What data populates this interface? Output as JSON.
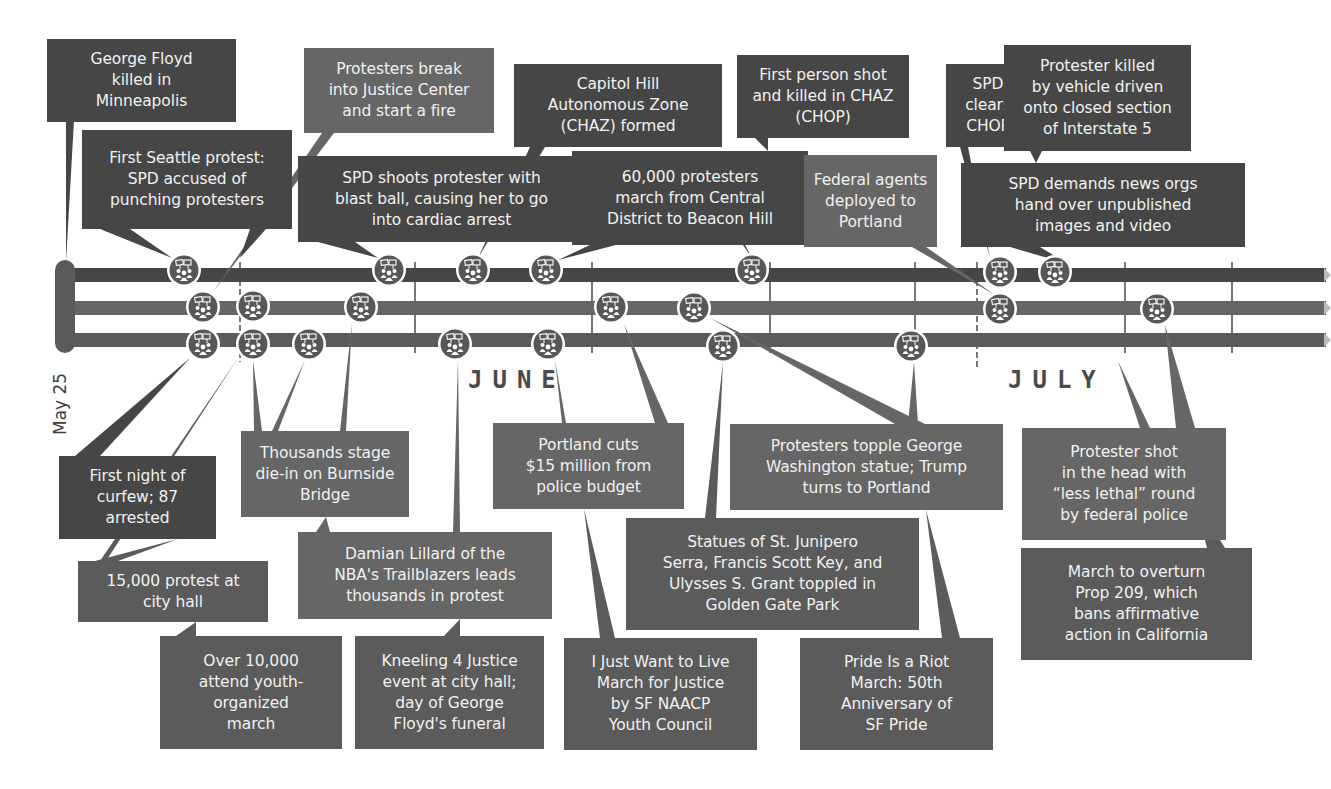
{
  "colors": {
    "seattle": "#464646",
    "portland": "#666666",
    "sf": "#5b5b5b",
    "icon_fill": "#575757",
    "icon_ring": "#ffffff",
    "background": "#ffffff"
  },
  "timeline": {
    "start_label": "May 25",
    "months": [
      {
        "label": "JUNE",
        "x": 468,
        "y": 366
      },
      {
        "label": "JULY",
        "x": 1008,
        "y": 366
      }
    ],
    "tracks": [
      {
        "name": "seattle",
        "y": 275,
        "color": "#464646"
      },
      {
        "name": "portland",
        "y": 308,
        "color": "#666666"
      },
      {
        "name": "sf",
        "y": 340,
        "color": "#5b5b5b"
      }
    ],
    "ticks": [
      {
        "x": 240,
        "top": 262,
        "bottom": 362,
        "dashed": true
      },
      {
        "x": 415,
        "top": 262,
        "bottom": 353
      },
      {
        "x": 592,
        "top": 262,
        "bottom": 353
      },
      {
        "x": 770,
        "top": 262,
        "bottom": 353
      },
      {
        "x": 915,
        "top": 262,
        "bottom": 353
      },
      {
        "x": 977,
        "top": 262,
        "bottom": 370,
        "dashed": true
      },
      {
        "x": 1125,
        "top": 262,
        "bottom": 353
      },
      {
        "x": 1232,
        "top": 262,
        "bottom": 353
      }
    ],
    "icon_name": "protest-crowd-icon",
    "icons": [
      {
        "track": 0,
        "x": 184,
        "y": 270
      },
      {
        "track": 0,
        "x": 389,
        "y": 270
      },
      {
        "track": 0,
        "x": 473,
        "y": 270
      },
      {
        "track": 0,
        "x": 546,
        "y": 270
      },
      {
        "track": 0,
        "x": 752,
        "y": 270
      },
      {
        "track": 0,
        "x": 1000,
        "y": 272
      },
      {
        "track": 0,
        "x": 1055,
        "y": 272
      },
      {
        "track": 1,
        "x": 203,
        "y": 307
      },
      {
        "track": 1,
        "x": 253,
        "y": 306
      },
      {
        "track": 1,
        "x": 361,
        "y": 307
      },
      {
        "track": 1,
        "x": 611,
        "y": 307
      },
      {
        "track": 1,
        "x": 694,
        "y": 308
      },
      {
        "track": 1,
        "x": 1000,
        "y": 309
      },
      {
        "track": 1,
        "x": 1157,
        "y": 309
      },
      {
        "track": 2,
        "x": 203,
        "y": 344
      },
      {
        "track": 2,
        "x": 253,
        "y": 344
      },
      {
        "track": 2,
        "x": 309,
        "y": 344
      },
      {
        "track": 2,
        "x": 455,
        "y": 344
      },
      {
        "track": 2,
        "x": 548,
        "y": 344
      },
      {
        "track": 2,
        "x": 723,
        "y": 346
      },
      {
        "track": 2,
        "x": 911,
        "y": 346
      }
    ]
  },
  "events": [
    {
      "id": "george-floyd",
      "city": "seattle",
      "text": [
        "George Floyd",
        "killed in",
        "Minneapolis"
      ],
      "box": [
        47,
        39,
        189,
        83
      ],
      "pointer": [
        [
          66,
          120
        ],
        [
          74,
          120
        ],
        [
          66,
          262
        ]
      ]
    },
    {
      "id": "justice-center-fire",
      "city": "portland",
      "text": [
        "Protesters break",
        "into Justice Center",
        "and start a fire"
      ],
      "box": [
        304,
        48,
        190,
        85
      ],
      "pointer": [
        [
          322,
          133
        ],
        [
          334,
          133
        ],
        [
          213,
          292
        ]
      ]
    },
    {
      "id": "first-seattle-protest",
      "city": "seattle",
      "text": [
        "First Seattle protest:",
        "SPD accused of",
        "punching protesters"
      ],
      "box": [
        82,
        130,
        210,
        99
      ],
      "pointer": [
        [
          100,
          229
        ],
        [
          130,
          229
        ],
        [
          172,
          258
        ]
      ],
      "pointer2": [
        [
          250,
          229
        ],
        [
          266,
          229
        ],
        [
          240,
          258
        ]
      ]
    },
    {
      "id": "capitol-hill-chaz",
      "city": "seattle",
      "text": [
        "Capitol Hill",
        "Autonomous Zone",
        "(CHAZ) formed"
      ],
      "box": [
        514,
        64,
        208,
        83
      ],
      "pointer": [
        [
          530,
          147
        ],
        [
          545,
          147
        ],
        [
          478,
          258
        ]
      ]
    },
    {
      "id": "blast-ball",
      "city": "seattle",
      "text": [
        "SPD shoots protester with",
        "blast ball, causing her to go",
        "into cardiac arrest"
      ],
      "box": [
        298,
        156,
        287,
        86
      ],
      "pointer": [
        [
          318,
          242
        ],
        [
          355,
          242
        ],
        [
          378,
          258
        ]
      ]
    },
    {
      "id": "sixty-thousand-march",
      "city": "seattle",
      "text": [
        "60,000 protesters",
        "march from Central",
        "District to Beacon Hill"
      ],
      "box": [
        572,
        151,
        236,
        94
      ],
      "pointer": [
        [
          590,
          245
        ],
        [
          616,
          245
        ],
        [
          558,
          260
        ]
      ],
      "pointer2": [
        [
          743,
          245
        ],
        [
          745,
          245
        ],
        [
          752,
          258
        ]
      ]
    },
    {
      "id": "first-person-shot-chaz",
      "city": "seattle",
      "text": [
        "First person shot",
        "and killed in CHAZ",
        "(CHOP)"
      ],
      "box": [
        737,
        55,
        172,
        83
      ],
      "pointer": [
        [
          755,
          138
        ],
        [
          768,
          138
        ],
        [
          768,
          151
        ]
      ]
    },
    {
      "id": "spd-clears-chop",
      "city": "seattle",
      "text": [
        "SPD",
        "clears",
        "CHOP"
      ],
      "box": [
        946,
        64,
        84,
        83
      ],
      "pointer": [
        [
          960,
          147
        ],
        [
          968,
          147
        ],
        [
          990,
          258
        ]
      ]
    },
    {
      "id": "interstate-5",
      "city": "seattle",
      "text": [
        "Protester killed",
        "by vehicle driven",
        "onto closed section",
        "of Interstate 5"
      ],
      "box": [
        1004,
        45,
        187,
        106
      ],
      "pointer": [
        [
          1030,
          151
        ],
        [
          1042,
          151
        ],
        [
          1036,
          163
        ]
      ]
    },
    {
      "id": "federal-agents",
      "city": "portland",
      "text": [
        "Federal agents",
        "deployed to",
        "Portland"
      ],
      "box": [
        804,
        155,
        133,
        92
      ],
      "pointer": [
        [
          912,
          247
        ],
        [
          926,
          247
        ],
        [
          995,
          295
        ]
      ]
    },
    {
      "id": "news-orgs",
      "city": "seattle",
      "text": [
        "SPD demands news orgs",
        "hand over unpublished",
        "images and video"
      ],
      "box": [
        961,
        163,
        284,
        84
      ],
      "pointer": [
        [
          1010,
          247
        ],
        [
          1040,
          247
        ],
        [
          1068,
          264
        ]
      ],
      "pointer2": [
        [
          1016,
          247
        ],
        [
          1018,
          247
        ],
        [
          1056,
          258
        ]
      ]
    },
    {
      "id": "first-night-curfew",
      "city": "seattle",
      "text": [
        "First night of",
        "curfew; 87",
        "arrested"
      ],
      "box": [
        59,
        456,
        157,
        83
      ],
      "pointer": [
        [
          75,
          456
        ],
        [
          100,
          456
        ],
        [
          190,
          358
        ]
      ]
    },
    {
      "id": "fifteen-thousand-city-hall",
      "city": "sf",
      "text": [
        "15,000 protest at",
        "city hall"
      ],
      "box": [
        78,
        561,
        190,
        61
      ],
      "pointer": [
        [
          95,
          561
        ],
        [
          118,
          561
        ],
        [
          178,
          539
        ]
      ],
      "pointer2": [
        [
          100,
          561
        ],
        [
          106,
          561
        ],
        [
          238,
          358
        ]
      ]
    },
    {
      "id": "die-in-burnside",
      "city": "portland",
      "text": [
        "Thousands stage",
        "die-in on Burnside",
        "Bridge"
      ],
      "box": [
        241,
        431,
        168,
        86
      ],
      "pointer": [
        [
          254,
          431
        ],
        [
          262,
          431
        ],
        [
          253,
          360
        ]
      ],
      "pointer2": [
        [
          272,
          431
        ],
        [
          278,
          431
        ],
        [
          305,
          360
        ]
      ],
      "pointer3": [
        [
          340,
          431
        ],
        [
          346,
          431
        ],
        [
          352,
          323
        ]
      ]
    },
    {
      "id": "damian-lillard",
      "city": "portland",
      "text": [
        "Damian Lillard of the",
        "NBA's Trailblazers leads",
        "thousands in protest"
      ],
      "box": [
        298,
        532,
        254,
        87
      ],
      "pointer": [
        [
          316,
          532
        ],
        [
          330,
          532
        ],
        [
          326,
          517
        ]
      ],
      "pointer2": [
        [
          453,
          532
        ],
        [
          460,
          532
        ],
        [
          458,
          360
        ]
      ]
    },
    {
      "id": "youth-march",
      "city": "sf",
      "text": [
        "Over 10,000",
        "attend youth-",
        "organized",
        "march"
      ],
      "box": [
        160,
        636,
        182,
        113
      ],
      "pointer": [
        [
          176,
          636
        ],
        [
          196,
          636
        ],
        [
          196,
          622
        ]
      ]
    },
    {
      "id": "kneeling-4-justice",
      "city": "sf",
      "text": [
        "Kneeling 4 Justice",
        "event at city hall;",
        "day of George",
        "Floyd's funeral"
      ],
      "box": [
        355,
        636,
        189,
        113
      ],
      "pointer": [
        [
          444,
          636
        ],
        [
          460,
          636
        ],
        [
          460,
          619
        ]
      ]
    },
    {
      "id": "portland-cuts-budget",
      "city": "portland",
      "text": [
        "Portland cuts",
        "$15 million from",
        "police budget"
      ],
      "box": [
        493,
        423,
        191,
        86
      ],
      "pointer": [
        [
          562,
          423
        ],
        [
          566,
          423
        ],
        [
          555,
          360
        ]
      ],
      "pointer2": [
        [
          655,
          423
        ],
        [
          668,
          423
        ],
        [
          624,
          324
        ]
      ]
    },
    {
      "id": "i-just-want-to-live",
      "city": "sf",
      "text": [
        "I Just Want to Live",
        "March for Justice",
        "by SF NAACP",
        "Youth Council"
      ],
      "box": [
        564,
        638,
        193,
        112
      ],
      "pointer": [
        [
          600,
          638
        ],
        [
          615,
          638
        ],
        [
          584,
          509
        ]
      ]
    },
    {
      "id": "statues-golden-gate",
      "city": "sf",
      "text": [
        "Statues of St. Junipero",
        "Serra, Francis Scott Key, and",
        "Ulysses S. Grant toppled in",
        "Golden Gate Park"
      ],
      "box": [
        626,
        518,
        293,
        112
      ],
      "pointer": [
        [
          705,
          518
        ],
        [
          716,
          518
        ],
        [
          723,
          362
        ]
      ]
    },
    {
      "id": "george-washington-statue",
      "city": "portland",
      "text": [
        "Protesters topple George",
        "Washington statue; Trump",
        "turns to Portland"
      ],
      "box": [
        730,
        424,
        273,
        86
      ],
      "pointer": [
        [
          895,
          424
        ],
        [
          925,
          424
        ],
        [
          710,
          318
        ]
      ],
      "pointer2": [
        [
          908,
          424
        ],
        [
          918,
          424
        ],
        [
          914,
          362
        ]
      ]
    },
    {
      "id": "pride-is-a-riot",
      "city": "sf",
      "text": [
        "Pride Is a Riot",
        "March: 50th",
        "Anniversary of",
        "SF Pride"
      ],
      "box": [
        800,
        638,
        193,
        112
      ],
      "pointer": [
        [
          942,
          638
        ],
        [
          960,
          638
        ],
        [
          926,
          510
        ]
      ]
    },
    {
      "id": "less-lethal-round",
      "city": "portland",
      "text": [
        "Protester shot",
        "in the head with",
        "“less lethal” round",
        "by federal police"
      ],
      "box": [
        1022,
        428,
        204,
        112
      ],
      "pointer": [
        [
          1140,
          428
        ],
        [
          1150,
          428
        ],
        [
          1118,
          361
        ]
      ],
      "pointer2": [
        [
          1176,
          428
        ],
        [
          1195,
          428
        ],
        [
          1165,
          325
        ]
      ]
    },
    {
      "id": "prop-209",
      "city": "sf",
      "text": [
        "March to overturn",
        "Prop 209, which",
        "bans affirmative",
        "action in California"
      ],
      "box": [
        1021,
        548,
        231,
        112
      ],
      "pointer": [
        [
          1207,
          548
        ],
        [
          1225,
          548
        ],
        [
          1195,
          500
        ]
      ]
    }
  ]
}
